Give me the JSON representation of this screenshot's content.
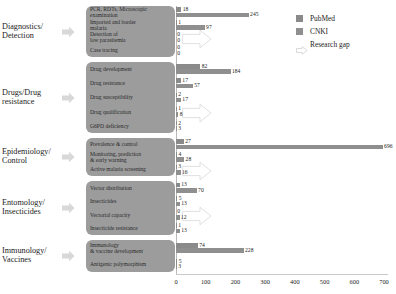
{
  "legend": {
    "items": [
      {
        "label": "PubMed",
        "color": "#8a8a8a",
        "icon": "square-swatch"
      },
      {
        "label": "CNKI",
        "color": "#8f8f8f",
        "icon": "square-swatch"
      },
      {
        "label": "Research gap",
        "color": "#ffffff",
        "icon": "arrow-outline"
      }
    ]
  },
  "axis": {
    "ticks": [
      "0",
      "100",
      "200",
      "300",
      "400",
      "500",
      "600",
      "700"
    ]
  },
  "chart_data": {
    "type": "bar",
    "title": "",
    "xlabel": "",
    "ylabel": "",
    "xlim": [
      0,
      700
    ],
    "grid": false,
    "orientation": "horizontal",
    "legend_position": "top-right",
    "series": [
      {
        "name": "PubMed",
        "color": "#8a8a8a"
      },
      {
        "name": "CNKI",
        "color": "#8f8f8f"
      }
    ],
    "groups": [
      {
        "category": "Diagnostics/\nDetection",
        "category_line1": "Diagnostics/",
        "category_line2": "Detection",
        "items": [
          {
            "label": "PCR, RDTs, Microscopic examination",
            "label_line1": "PCR, RDTs, Microscopic",
            "label_line2": "examination",
            "PubMed": 18,
            "CNKI": 245,
            "research_gap": false
          },
          {
            "label": "Imported and border malaria",
            "label_line1": "Imported and border",
            "label_line2": "malaria",
            "PubMed": 1,
            "CNKI": 97,
            "research_gap": false
          },
          {
            "label": "Detection of low parasitemia",
            "label_line1": "Detection of",
            "label_line2": "low parasitemia",
            "PubMed": 0,
            "CNKI": 0,
            "research_gap": true
          },
          {
            "label": "Case tracing",
            "label_line1": "Case tracing",
            "label_line2": "",
            "PubMed": 0,
            "CNKI": 0,
            "research_gap": false
          }
        ]
      },
      {
        "category": "Drugs/Drug resistance",
        "category_line1": "Drugs/Drug",
        "category_line2": "resistance",
        "items": [
          {
            "label": "Drug development",
            "label_line1": "Drug development",
            "label_line2": "",
            "PubMed": 82,
            "CNKI": 184,
            "research_gap": false
          },
          {
            "label": "Drug resistance",
            "label_line1": "Drug resistance",
            "label_line2": "",
            "PubMed": 17,
            "CNKI": 57,
            "research_gap": false
          },
          {
            "label": "Drug susceptibility",
            "label_line1": "Drug susceptibility",
            "label_line2": "",
            "PubMed": 2,
            "CNKI": 17,
            "research_gap": false
          },
          {
            "label": "Drug qualification",
            "label_line1": "Drug qualification",
            "label_line2": "",
            "PubMed": 1,
            "CNKI": 8,
            "research_gap": true
          },
          {
            "label": "G6PD deficiency",
            "label_line1": "G6PD deficiency",
            "label_line2": "",
            "PubMed": 2,
            "CNKI": 3,
            "research_gap": false
          }
        ]
      },
      {
        "category": "Epidemiology/\nControl",
        "category_line1": "Epidemiology/",
        "category_line2": "Control",
        "items": [
          {
            "label": "Prevalence & control",
            "label_line1": "Prevalence & control",
            "label_line2": "",
            "PubMed": 27,
            "CNKI": 696,
            "research_gap": false
          },
          {
            "label": "Monitoring, prediction & early warning",
            "label_line1": "Monitoring, prediction",
            "label_line2": "& early warning",
            "PubMed": 4,
            "CNKI": 28,
            "research_gap": false
          },
          {
            "label": "Active malaria screening",
            "label_line1": "Active malaria screening",
            "label_line2": "",
            "PubMed": 3,
            "CNKI": 16,
            "research_gap": true
          }
        ]
      },
      {
        "category": "Entomology/\nInsecticides",
        "category_line1": "Entomology/",
        "category_line2": "Insecticides",
        "items": [
          {
            "label": "Vector distribution",
            "label_line1": "Vector distribution",
            "label_line2": "",
            "PubMed": 13,
            "CNKI": 70,
            "research_gap": false
          },
          {
            "label": "Insecticides",
            "label_line1": "Insecticides",
            "label_line2": "",
            "PubMed": 5,
            "CNKI": 13,
            "research_gap": false
          },
          {
            "label": "Vectorial capacity",
            "label_line1": "Vectorial capacity",
            "label_line2": "",
            "PubMed": 0,
            "CNKI": 12,
            "research_gap": true
          },
          {
            "label": "Insecticide resistance",
            "label_line1": "Insecticide resistance",
            "label_line2": "",
            "PubMed": 1,
            "CNKI": 13,
            "research_gap": false
          }
        ]
      },
      {
        "category": "Immunology/\nVaccines",
        "category_line1": "Immunology/",
        "category_line2": "Vaccines",
        "items": [
          {
            "label": "Immunology & vaccine development",
            "label_line1": "Immunology",
            "label_line2": "& vaccine development",
            "PubMed": 74,
            "CNKI": 228,
            "research_gap": false
          },
          {
            "label": "Antigenic polymorphism",
            "label_line1": "Antigenic polymorphism",
            "label_line2": "",
            "PubMed": 5,
            "CNKI": 3,
            "research_gap": false
          }
        ]
      }
    ]
  }
}
